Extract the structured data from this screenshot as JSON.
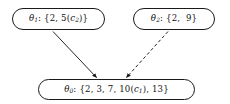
{
  "diagram": {
    "type": "directed-graph",
    "background_color": "#ffffff",
    "stroke_color": "#1a1a1a",
    "width": 230,
    "height": 104,
    "nodes": [
      {
        "id": "theta1",
        "label_symbol": "θ",
        "label_subscript": "1",
        "separator": ":",
        "set_text": "{2, 5(c₂)}",
        "full_text": "θ₁: {2, 5(c₂)}",
        "elements": [
          "2",
          "5(c₂)"
        ],
        "position": "top-left"
      },
      {
        "id": "theta2",
        "label_symbol": "θ",
        "label_subscript": "2",
        "separator": ":",
        "set_text": "{2, 9}",
        "full_text": "θ₂: {2, 9}",
        "elements": [
          "2",
          "9"
        ],
        "position": "top-right"
      },
      {
        "id": "theta0",
        "label_symbol": "θ",
        "label_subscript": "0",
        "separator": ":",
        "set_text": "{2, 3, 7, 10(c₁), 13}",
        "full_text": "θ₀: {2, 3, 7, 10(c₁), 13}",
        "elements": [
          "2",
          "3",
          "7",
          "10(c₁)",
          "13"
        ],
        "position": "bottom-center"
      }
    ],
    "edges": [
      {
        "id": "edge-theta1-theta0",
        "from": "theta1",
        "to": "theta0",
        "style": "solid",
        "arrowhead": "filled-triangle"
      },
      {
        "id": "edge-theta2-theta0",
        "from": "theta2",
        "to": "theta0",
        "style": "dashed",
        "arrowhead": "filled-triangle"
      }
    ]
  }
}
